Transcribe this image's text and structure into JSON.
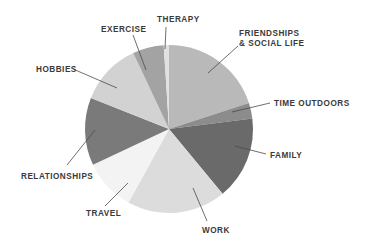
{
  "chart_data": {
    "type": "pie",
    "title": "",
    "start_angle_deg": 0,
    "direction": "clockwise",
    "legend_position": "none (callout labels)",
    "slices": [
      {
        "label": "FRIENDSHIPS & SOCIAL LIFE",
        "label_lines": [
          "FRIENDSHIPS",
          "& SOCIAL LIFE"
        ],
        "value": 20,
        "color": "#b9b9b9"
      },
      {
        "label": "TIME OUTDOORS",
        "label_lines": [
          "TIME OUTDOORS"
        ],
        "value": 3,
        "color": "#8c8c8c"
      },
      {
        "label": "FAMILY",
        "label_lines": [
          "FAMILY"
        ],
        "value": 16,
        "color": "#6a6a6a"
      },
      {
        "label": "WORK",
        "label_lines": [
          "WORK"
        ],
        "value": 19,
        "color": "#dcdcdc"
      },
      {
        "label": "TRAVEL",
        "label_lines": [
          "TRAVEL"
        ],
        "value": 10,
        "color": "#f3f3f3"
      },
      {
        "label": "RELATIONSHIPS",
        "label_lines": [
          "RELATIONSHIPS"
        ],
        "value": 13,
        "color": "#7a7a7a"
      },
      {
        "label": "HOBBIES",
        "label_lines": [
          "HOBBIES"
        ],
        "value": 12,
        "color": "#d2d2d2"
      },
      {
        "label": "EXERCISE",
        "label_lines": [
          "EXERCISE"
        ],
        "value": 6,
        "color": "#a3a3a3"
      },
      {
        "label": "THERAPY",
        "label_lines": [
          "THERAPY"
        ],
        "value": 1,
        "color": "#e0e0e0"
      }
    ]
  },
  "labels": [
    {
      "text_lines": [
        "FRIENDSHIPS",
        "& SOCIAL LIFE"
      ],
      "x": 239,
      "y": 36,
      "anchor": "start",
      "line": [
        [
          208,
          73
        ],
        [
          238,
          46
        ]
      ]
    },
    {
      "text_lines": [
        "TIME OUTDOORS"
      ],
      "x": 274,
      "y": 106,
      "anchor": "start",
      "line": [
        [
          232,
          112
        ],
        [
          270,
          103
        ]
      ]
    },
    {
      "text_lines": [
        "FAMILY"
      ],
      "x": 270,
      "y": 158,
      "anchor": "start",
      "line": [
        [
          235,
          146
        ],
        [
          266,
          154
        ]
      ]
    },
    {
      "text_lines": [
        "WORK"
      ],
      "x": 202,
      "y": 233,
      "anchor": "start",
      "line": [
        [
          193,
          188
        ],
        [
          207,
          221
        ]
      ]
    },
    {
      "text_lines": [
        "TRAVEL"
      ],
      "x": 86,
      "y": 216,
      "anchor": "start",
      "line": [
        [
          128,
          183
        ],
        [
          105,
          206
        ]
      ]
    },
    {
      "text_lines": [
        "RELATIONSHIPS"
      ],
      "x": 21,
      "y": 179,
      "anchor": "start",
      "line": [
        [
          95,
          130
        ],
        [
          67,
          165
        ]
      ]
    },
    {
      "text_lines": [
        "HOBBIES"
      ],
      "x": 36,
      "y": 72,
      "anchor": "start",
      "line": [
        [
          117,
          88
        ],
        [
          73,
          69
        ]
      ]
    },
    {
      "text_lines": [
        "EXERCISE"
      ],
      "x": 101,
      "y": 32,
      "anchor": "start",
      "line": [
        [
          146,
          70
        ],
        [
          133,
          35
        ]
      ]
    },
    {
      "text_lines": [
        "THERAPY"
      ],
      "x": 157,
      "y": 22,
      "anchor": "start",
      "line": [
        [
          165,
          49
        ],
        [
          166,
          27
        ]
      ]
    }
  ]
}
